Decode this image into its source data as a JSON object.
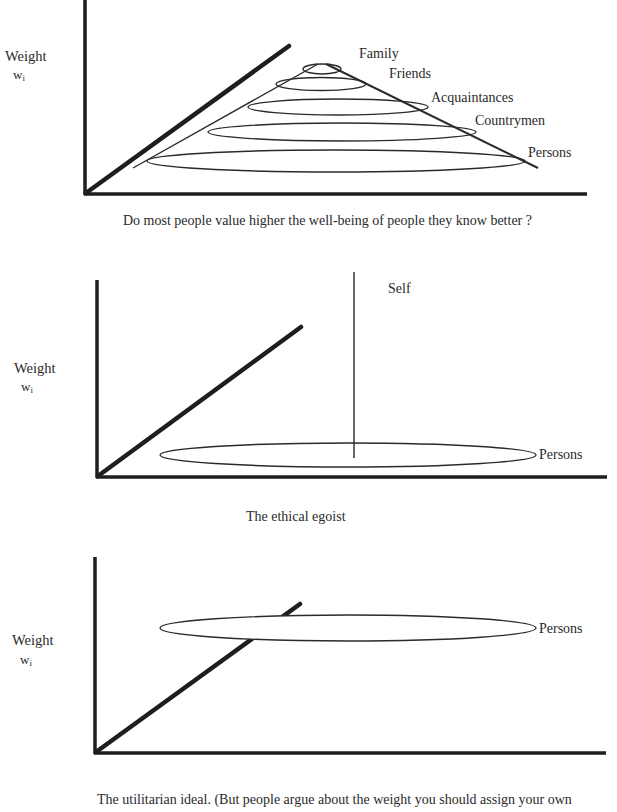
{
  "panels": [
    {
      "id": "concentric",
      "y_label": "Weight",
      "y_symbol": "w",
      "y_symbol_sub": "i",
      "ellipse_labels": [
        "Family",
        "Friends",
        "Acquaintances",
        "Countrymen",
        "Persons"
      ],
      "caption": "Do most people value higher the well-being of people they know better ?"
    },
    {
      "id": "egoist",
      "y_label": "Weight",
      "y_symbol": "w",
      "y_symbol_sub": "i",
      "spike_label": "Self",
      "ellipse_label": "Persons",
      "caption": "The ethical egoist"
    },
    {
      "id": "utilitarian",
      "y_label": "Weight",
      "y_symbol": "w",
      "y_symbol_sub": "i",
      "ellipse_label": "Persons",
      "caption": "The utilitarian ideal.  (But people argue about the weight you should assign your own"
    }
  ],
  "colors": {
    "ink": "#2a2a2a",
    "background": "#ffffff"
  }
}
